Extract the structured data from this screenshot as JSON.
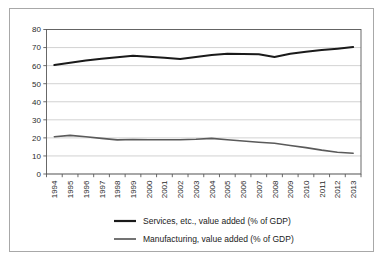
{
  "chart_data": {
    "type": "line",
    "title": "",
    "subtitle": "",
    "xlabel": "",
    "ylabel": "",
    "categories": [
      "1994",
      "1995",
      "1996",
      "1997",
      "1998",
      "1999",
      "2000",
      "2001",
      "2002",
      "2003",
      "2004",
      "2005",
      "2006",
      "2007",
      "2008",
      "2009",
      "2010",
      "2011",
      "2012",
      "2013"
    ],
    "ylim": [
      0,
      80
    ],
    "yticks": [
      0,
      10,
      20,
      30,
      40,
      50,
      60,
      70,
      80
    ],
    "ytick_labels": [
      "0",
      "10",
      "20",
      "30",
      "40",
      "50",
      "60",
      "70",
      "80"
    ],
    "grid": true,
    "legend_position": "bottom",
    "series": [
      {
        "name": "Services, etc., value added (% of GDP)",
        "color": "#1a1a1a",
        "line_width": 2.0,
        "values": [
          60.3,
          61.6,
          62.8,
          63.8,
          64.6,
          65.5,
          64.9,
          64.4,
          63.7,
          64.8,
          65.9,
          66.6,
          66.5,
          66.3,
          64.8,
          66.6,
          67.7,
          68.6,
          69.4,
          70.3
        ]
      },
      {
        "name": "Manufacturing, value added (% of GDP)",
        "color": "#5a5a5a",
        "line_width": 1.6,
        "values": [
          20.6,
          21.4,
          20.6,
          19.7,
          18.9,
          19.1,
          19.0,
          19.0,
          19.0,
          19.2,
          19.7,
          19.0,
          18.3,
          17.6,
          17.0,
          15.8,
          14.6,
          13.2,
          12.0,
          11.5
        ]
      }
    ]
  },
  "legend": {
    "items": [
      {
        "label": "Services, etc., value added (% of GDP)",
        "color": "#1a1a1a"
      },
      {
        "label": "Manufacturing, value added (% of GDP)",
        "color": "#5a5a5a"
      }
    ]
  },
  "colors": {
    "background": "#ffffff",
    "outer_border": "#a8a8a8",
    "gridline": "#bfbfbf",
    "axis": "#595959",
    "text": "#2b2b2b"
  }
}
